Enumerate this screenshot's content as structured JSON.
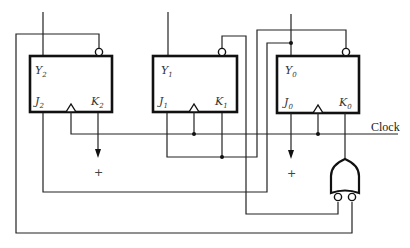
{
  "diagram": {
    "title": "",
    "flip_flops": [
      {
        "id": "ff2",
        "y_label": "Y",
        "y_sub": "2",
        "j_label": "J",
        "j_sub": "2",
        "k_label": "K",
        "k_sub": "2"
      },
      {
        "id": "ff1",
        "y_label": "Y",
        "y_sub": "1",
        "j_label": "J",
        "j_sub": "1",
        "k_label": "K",
        "k_sub": "1"
      },
      {
        "id": "ff0",
        "y_label": "Y",
        "y_sub": "0",
        "j_label": "J",
        "j_sub": "0",
        "k_label": "K",
        "k_sub": "0"
      }
    ],
    "clock_label": "Clock",
    "plus_labels": [
      "+",
      "+"
    ],
    "gates": [
      {
        "type": "OR",
        "inverted_inputs": 2
      }
    ],
    "colors": {
      "line": "#222222",
      "background": "#ffffff"
    }
  }
}
